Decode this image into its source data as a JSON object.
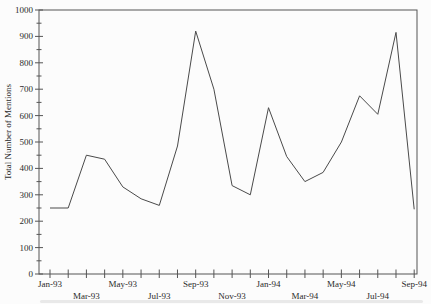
{
  "page": {
    "background": "#fcfcfc",
    "text_color": "#2b2b2b"
  },
  "chart_data": {
    "type": "line",
    "title": "",
    "xlabel": "",
    "ylabel": "Total Number of Mentions",
    "ylim": [
      0,
      1000
    ],
    "y_ticks": [
      0,
      100,
      200,
      300,
      400,
      500,
      600,
      700,
      800,
      900,
      1000
    ],
    "y_minor_tick_step": 50,
    "grid": false,
    "legend": "none",
    "frame": true,
    "line_color": "#4a4a4a",
    "axis_color": "#555555",
    "x_label_every": 2,
    "x_label_alternate_rows": true,
    "categories": [
      "Jan-93",
      "Feb-93",
      "Mar-93",
      "Apr-93",
      "May-93",
      "Jun-93",
      "Jul-93",
      "Aug-93",
      "Sep-93",
      "Oct-93",
      "Nov-93",
      "Dec-93",
      "Jan-94",
      "Feb-94",
      "Mar-94",
      "Apr-94",
      "May-94",
      "Jun-94",
      "Jul-94",
      "Aug-94",
      "Sep-94"
    ],
    "values": [
      250,
      250,
      450,
      435,
      330,
      285,
      260,
      485,
      920,
      700,
      335,
      300,
      630,
      445,
      350,
      385,
      500,
      675,
      605,
      915,
      245
    ]
  }
}
